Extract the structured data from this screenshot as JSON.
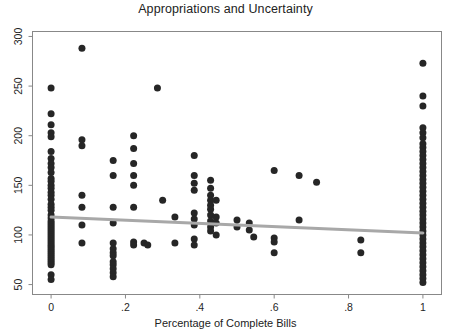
{
  "chart_data": {
    "type": "scatter",
    "title": "Appropriations and Uncertainty",
    "xlabel": "Percentage of Complete Bills",
    "ylabel": "",
    "xlim": [
      -0.05,
      1.05
    ],
    "ylim": [
      40,
      305
    ],
    "grid": false,
    "legend": null,
    "xticks": [
      0,
      0.2,
      0.4,
      0.6,
      0.8,
      1
    ],
    "xtick_labels": [
      "0",
      ".2",
      ".4",
      ".6",
      ".8",
      "1"
    ],
    "yticks": [
      50,
      100,
      150,
      200,
      250,
      300
    ],
    "ytick_labels": [
      "50",
      "100",
      "150",
      "200",
      "250",
      "300"
    ],
    "marker_color": "#262626",
    "marker_size": 4.6,
    "fit_line": {
      "name": "linear fit",
      "color": "#a8a8a8",
      "width": 3.0,
      "x": [
        0.0,
        1.0
      ],
      "y": [
        118,
        102
      ]
    },
    "points": [
      [
        0.0,
        248
      ],
      [
        0.0,
        222
      ],
      [
        0.0,
        211
      ],
      [
        0.0,
        203
      ],
      [
        0.0,
        199
      ],
      [
        0.0,
        184
      ],
      [
        0.0,
        177
      ],
      [
        0.0,
        172
      ],
      [
        0.0,
        168
      ],
      [
        0.0,
        163
      ],
      [
        0.0,
        157
      ],
      [
        0.0,
        154
      ],
      [
        0.0,
        150
      ],
      [
        0.0,
        147
      ],
      [
        0.0,
        143
      ],
      [
        0.0,
        140
      ],
      [
        0.0,
        136
      ],
      [
        0.0,
        131
      ],
      [
        0.0,
        128
      ],
      [
        0.0,
        125
      ],
      [
        0.0,
        120
      ],
      [
        0.0,
        117
      ],
      [
        0.0,
        114
      ],
      [
        0.0,
        112
      ],
      [
        0.0,
        110
      ],
      [
        0.0,
        108
      ],
      [
        0.0,
        106
      ],
      [
        0.0,
        104
      ],
      [
        0.0,
        102
      ],
      [
        0.0,
        100
      ],
      [
        0.0,
        98
      ],
      [
        0.0,
        96
      ],
      [
        0.0,
        94
      ],
      [
        0.0,
        92
      ],
      [
        0.0,
        90
      ],
      [
        0.0,
        88
      ],
      [
        0.0,
        86
      ],
      [
        0.0,
        84
      ],
      [
        0.0,
        82
      ],
      [
        0.0,
        80
      ],
      [
        0.0,
        78
      ],
      [
        0.0,
        76
      ],
      [
        0.0,
        74
      ],
      [
        0.0,
        72
      ],
      [
        0.0,
        70
      ],
      [
        0.0,
        60
      ],
      [
        0.0,
        55
      ],
      [
        0.083,
        288
      ],
      [
        0.083,
        196
      ],
      [
        0.083,
        190
      ],
      [
        0.083,
        140
      ],
      [
        0.083,
        128
      ],
      [
        0.083,
        110
      ],
      [
        0.083,
        92
      ],
      [
        0.167,
        175
      ],
      [
        0.167,
        160
      ],
      [
        0.167,
        128
      ],
      [
        0.167,
        112
      ],
      [
        0.167,
        92
      ],
      [
        0.167,
        86
      ],
      [
        0.167,
        82
      ],
      [
        0.167,
        79
      ],
      [
        0.167,
        73
      ],
      [
        0.167,
        70
      ],
      [
        0.167,
        66
      ],
      [
        0.167,
        62
      ],
      [
        0.167,
        58
      ],
      [
        0.222,
        200
      ],
      [
        0.222,
        187
      ],
      [
        0.222,
        172
      ],
      [
        0.222,
        160
      ],
      [
        0.222,
        150
      ],
      [
        0.222,
        128
      ],
      [
        0.222,
        93
      ],
      [
        0.222,
        90
      ],
      [
        0.25,
        92
      ],
      [
        0.26,
        90
      ],
      [
        0.286,
        248
      ],
      [
        0.3,
        135
      ],
      [
        0.333,
        118
      ],
      [
        0.333,
        92
      ],
      [
        0.385,
        180
      ],
      [
        0.385,
        160
      ],
      [
        0.385,
        152
      ],
      [
        0.385,
        145
      ],
      [
        0.385,
        122
      ],
      [
        0.385,
        116
      ],
      [
        0.385,
        110
      ],
      [
        0.385,
        96
      ],
      [
        0.385,
        90
      ],
      [
        0.429,
        155
      ],
      [
        0.429,
        147
      ],
      [
        0.429,
        140
      ],
      [
        0.429,
        135
      ],
      [
        0.429,
        130
      ],
      [
        0.429,
        126
      ],
      [
        0.429,
        120
      ],
      [
        0.429,
        114
      ],
      [
        0.429,
        108
      ],
      [
        0.429,
        104
      ],
      [
        0.444,
        135
      ],
      [
        0.444,
        118
      ],
      [
        0.444,
        112
      ],
      [
        0.444,
        100
      ],
      [
        0.5,
        115
      ],
      [
        0.5,
        108
      ],
      [
        0.533,
        112
      ],
      [
        0.533,
        105
      ],
      [
        0.545,
        98
      ],
      [
        0.6,
        165
      ],
      [
        0.6,
        97
      ],
      [
        0.6,
        93
      ],
      [
        0.6,
        82
      ],
      [
        0.667,
        160
      ],
      [
        0.667,
        115
      ],
      [
        0.714,
        153
      ],
      [
        0.833,
        95
      ],
      [
        0.833,
        82
      ],
      [
        1.0,
        273
      ],
      [
        1.0,
        240
      ],
      [
        1.0,
        230
      ],
      [
        1.0,
        208
      ],
      [
        1.0,
        203
      ],
      [
        1.0,
        198
      ],
      [
        1.0,
        192
      ],
      [
        1.0,
        188
      ],
      [
        1.0,
        184
      ],
      [
        1.0,
        180
      ],
      [
        1.0,
        176
      ],
      [
        1.0,
        172
      ],
      [
        1.0,
        168
      ],
      [
        1.0,
        164
      ],
      [
        1.0,
        160
      ],
      [
        1.0,
        156
      ],
      [
        1.0,
        152
      ],
      [
        1.0,
        148
      ],
      [
        1.0,
        144
      ],
      [
        1.0,
        140
      ],
      [
        1.0,
        136
      ],
      [
        1.0,
        132
      ],
      [
        1.0,
        128
      ],
      [
        1.0,
        124
      ],
      [
        1.0,
        120
      ],
      [
        1.0,
        116
      ],
      [
        1.0,
        112
      ],
      [
        1.0,
        108
      ],
      [
        1.0,
        104
      ],
      [
        1.0,
        100
      ],
      [
        1.0,
        96
      ],
      [
        1.0,
        92
      ],
      [
        1.0,
        88
      ],
      [
        1.0,
        84
      ],
      [
        1.0,
        80
      ],
      [
        1.0,
        76
      ],
      [
        1.0,
        72
      ],
      [
        1.0,
        68
      ],
      [
        1.0,
        64
      ],
      [
        1.0,
        60
      ],
      [
        1.0,
        56
      ],
      [
        1.0,
        52
      ]
    ]
  },
  "figure": {
    "title": "Appropriations and Uncertainty",
    "xaxis_title": "Percentage of Complete Bills",
    "background_color": "#ffffff",
    "frame_color": "#888888"
  }
}
